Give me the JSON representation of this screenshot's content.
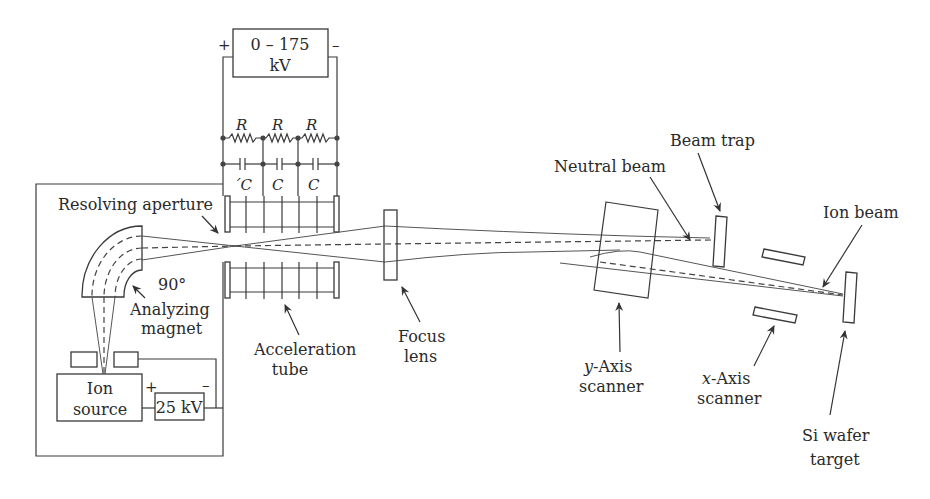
{
  "diagram": {
    "high_voltage_supply": {
      "label_line1": "0 – 175",
      "label_line2": "kV",
      "plus": "+",
      "minus": "–"
    },
    "divider": {
      "resistor_labels": [
        "R",
        "R",
        "R"
      ],
      "capacitor_labels": [
        "´C",
        "C",
        "C"
      ]
    },
    "extraction_supply": {
      "label": "25 kV",
      "plus": "+",
      "minus": "–"
    },
    "labels": {
      "resolving_aperture": "Resolving aperture",
      "magnet_angle": "90°",
      "analyzing_magnet_1": "Analyzing",
      "analyzing_magnet_2": "magnet",
      "ion_source_1": "Ion",
      "ion_source_2": "source",
      "acceleration_tube_1": "Acceleration",
      "acceleration_tube_2": "tube",
      "focus_lens_1": "Focus",
      "focus_lens_2": "lens",
      "neutral_beam": "Neutral beam",
      "beam_trap": "Beam trap",
      "ion_beam": "Ion beam",
      "y_scanner_axis": "y",
      "y_scanner_rest": "-Axis",
      "y_scanner_2": "scanner",
      "x_scanner_axis": "x",
      "x_scanner_rest": "-Axis",
      "x_scanner_2": "scanner",
      "wafer_1": "Si wafer",
      "wafer_2": "target"
    },
    "colors": {
      "line": "#3a3a3a",
      "text": "#2a2a2a",
      "background": "#ffffff"
    }
  }
}
